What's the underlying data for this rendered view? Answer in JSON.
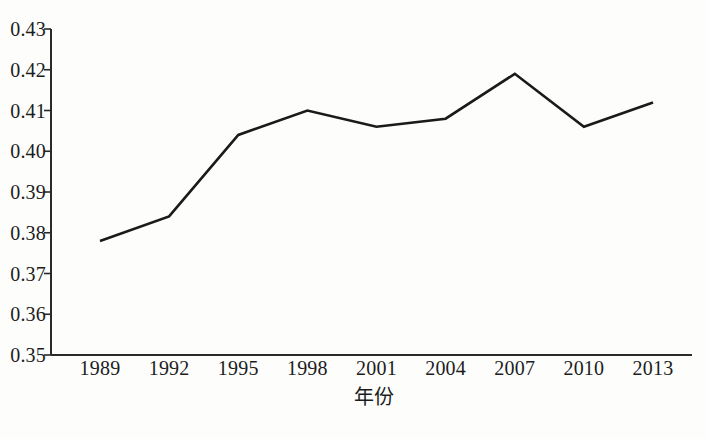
{
  "chart_data": {
    "type": "line",
    "title": "",
    "subtitle": "",
    "xlabel": "年份",
    "ylabel": "",
    "categories": [
      "1989",
      "1992",
      "1995",
      "1998",
      "2001",
      "2004",
      "2007",
      "2010",
      "2013"
    ],
    "x": [
      1989,
      1992,
      1995,
      1998,
      2001,
      2004,
      2007,
      2010,
      2013
    ],
    "values": [
      0.378,
      0.384,
      0.404,
      0.41,
      0.406,
      0.408,
      0.419,
      0.406,
      0.412
    ],
    "series": [
      {
        "name": "",
        "values": [
          0.378,
          0.384,
          0.404,
          0.41,
          0.406,
          0.408,
          0.419,
          0.406,
          0.412
        ],
        "color": "#1a1a1a"
      }
    ],
    "ylim": [
      0.35,
      0.43
    ],
    "xlim": [
      1989,
      2013
    ],
    "yticks": [
      "0.35",
      "0.36",
      "0.37",
      "0.38",
      "0.39",
      "0.40",
      "0.41",
      "0.42",
      "0.43"
    ],
    "ytick_values": [
      0.35,
      0.36,
      0.37,
      0.38,
      0.39,
      0.4,
      0.41,
      0.42,
      0.43
    ],
    "xticks": [
      "1989",
      "1992",
      "1995",
      "1998",
      "2001",
      "2004",
      "2007",
      "2010",
      "2013"
    ],
    "grid": false,
    "legend": false,
    "legend_position": "none",
    "annotations": [],
    "line_color": "#1a1a1a",
    "line_width": 2.6,
    "markers": false,
    "axis_color": "#2a2a2a",
    "background_color": "#fdfdfc"
  }
}
